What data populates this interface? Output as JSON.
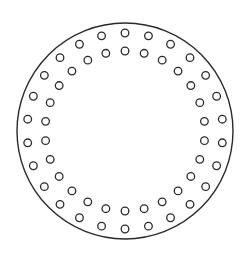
{
  "diagram": {
    "type": "circular-hole-pattern",
    "colors": {
      "stroke": "#2a2a2a",
      "background": "#ffffff"
    },
    "outer_circle": {
      "cx": 125,
      "cy": 131,
      "r": 108,
      "stroke_width": 1.4
    },
    "hole_rings": [
      {
        "name": "outer-ring",
        "count": 26,
        "radius": 98,
        "start_angle_deg": -90,
        "hole_r": 3.8
      },
      {
        "name": "inner-ring",
        "count": 26,
        "radius": 80,
        "start_angle_deg": -90,
        "hole_r": 3.8
      }
    ]
  }
}
